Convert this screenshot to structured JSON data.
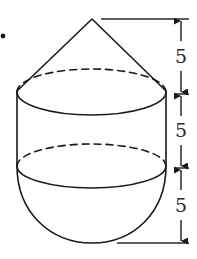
{
  "diagram": {
    "parts": [
      {
        "name": "cone",
        "height_label": "5"
      },
      {
        "name": "cylinder",
        "height_label": "5"
      },
      {
        "name": "hemisphere",
        "height_label": "5"
      }
    ],
    "dimension_labels": [
      "5",
      "5",
      "5"
    ],
    "bullet": "•",
    "colors": {
      "stroke": "#1a1a1a",
      "background": "#ffffff"
    }
  }
}
